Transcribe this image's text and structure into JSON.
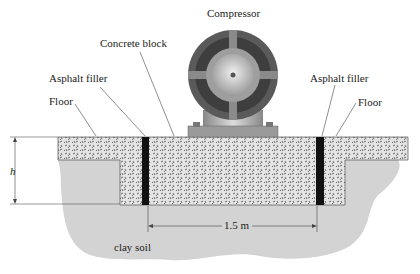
{
  "diagram": {
    "labels": {
      "compressor": "Compressor",
      "concrete_block": "Concrete block",
      "asphalt_filler_left": "Asphalt filler",
      "asphalt_filler_right": "Asphalt filler",
      "floor_left": "Floor",
      "floor_right": "Floor",
      "height": "h",
      "width": "1.5 m",
      "soil": "clay soil"
    },
    "colors": {
      "concrete": "#d9d9d9",
      "asphalt": "#111111",
      "soil": "#d3d3d3",
      "compressor_dark": "#5a5a5a",
      "compressor_light": "#b8b8b8"
    }
  }
}
